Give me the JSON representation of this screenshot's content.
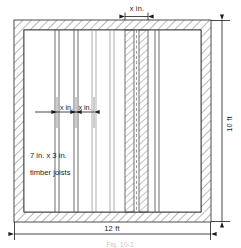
{
  "figure": {
    "caption": "Fig. 10-1",
    "colors": {
      "ink": "#1a1a1a",
      "wall": "#3a3a3a",
      "hatch": "#555555",
      "joist": "#4a4a4a",
      "background": "#ffffff"
    },
    "dimensions": {
      "top": {
        "label": "x in.",
        "name": "joist-spacing-top"
      },
      "right": {
        "label": "10 ft",
        "name": "room-height"
      },
      "bottom": {
        "label": "12 ft",
        "name": "room-width"
      },
      "interior_left": {
        "label": "x in.",
        "name": "joist-spacing-left"
      },
      "interior_right": {
        "label": "x in.",
        "name": "joist-spacing-right"
      }
    },
    "annotations": {
      "joist_size": "7 in. x  3 in.",
      "joist_material": "timber joists"
    }
  }
}
